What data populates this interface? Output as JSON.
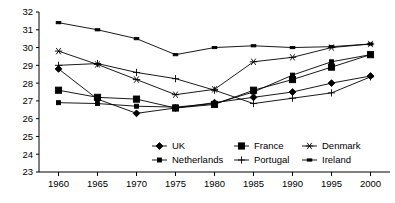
{
  "chart_data": {
    "type": "line",
    "title": "",
    "xlabel": "",
    "ylabel": "",
    "x": [
      1960,
      1965,
      1970,
      1975,
      1980,
      1985,
      1990,
      1995,
      2000
    ],
    "categories": [
      "1960",
      "1965",
      "1970",
      "1975",
      "1980",
      "1985",
      "1990",
      "1995",
      "2000"
    ],
    "xlim": [
      1957.5,
      2002.5
    ],
    "ylim": [
      23,
      32
    ],
    "yticks": [
      23,
      24,
      25,
      26,
      27,
      28,
      29,
      30,
      31,
      32
    ],
    "ytick_labels": [
      "23",
      "24",
      "25",
      "26",
      "27",
      "28",
      "29",
      "30",
      "31",
      "32"
    ],
    "grid": false,
    "legend_position": "bottom-inside",
    "series": [
      {
        "name": "UK",
        "marker": "diamond",
        "values": [
          28.8,
          27.1,
          26.3,
          26.6,
          26.9,
          27.2,
          27.5,
          28.0,
          28.4
        ]
      },
      {
        "name": "France",
        "marker": "square",
        "values": [
          27.6,
          27.2,
          27.1,
          26.6,
          26.8,
          27.6,
          28.2,
          28.9,
          29.6
        ]
      },
      {
        "name": "Denmark",
        "marker": "asterisk",
        "values": [
          29.8,
          29.05,
          28.2,
          27.35,
          27.65,
          29.2,
          29.45,
          30.0,
          30.2
        ]
      },
      {
        "name": "Netherlands",
        "marker": "small-square",
        "values": [
          26.9,
          26.85,
          26.7,
          26.65,
          26.85,
          27.5,
          28.45,
          29.2,
          29.6
        ]
      },
      {
        "name": "Portugal",
        "marker": "plus",
        "values": [
          29.0,
          29.1,
          28.6,
          28.25,
          27.6,
          26.85,
          27.15,
          27.45,
          28.35
        ]
      },
      {
        "name": "Ireland",
        "marker": "dash",
        "values": [
          31.4,
          31.0,
          30.5,
          29.6,
          30.0,
          30.1,
          30.0,
          30.05,
          30.2
        ]
      }
    ],
    "legend_rows": [
      [
        "UK",
        "France",
        "Denmark"
      ],
      [
        "Netherlands",
        "Portugal",
        "Ireland"
      ]
    ]
  }
}
